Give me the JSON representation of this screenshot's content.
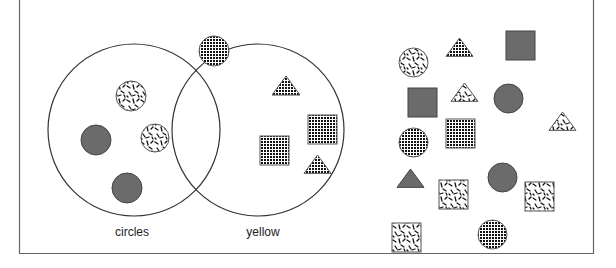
{
  "diagram": {
    "type": "venn",
    "frame": {
      "left": 19,
      "right": 593,
      "bottom": 253,
      "stroke": "#666666"
    },
    "sets": [
      {
        "id": "circles",
        "label": "circles",
        "cx": 134,
        "cy": 130,
        "r": 86,
        "label_x": 132,
        "label_y": 236
      },
      {
        "id": "yellow",
        "label": "yellow",
        "cx": 258,
        "cy": 130,
        "r": 86,
        "label_x": 263,
        "label_y": 236
      }
    ],
    "colors": {
      "solid_fill": "#6b6b6b",
      "outline": "#333333",
      "grid_ink": "#111111",
      "background": "#ffffff"
    },
    "fill_legend": {
      "solid": "solid gray fill",
      "grid": "checkered grid pattern",
      "speckle": "white with black speckle pattern"
    },
    "shapes": [
      {
        "kind": "circle",
        "fill": "grid",
        "x": 199,
        "y": 36,
        "size": 30,
        "region": "outside"
      },
      {
        "kind": "circle",
        "fill": "speckle",
        "x": 116,
        "y": 81,
        "size": 30,
        "region": "circles-only"
      },
      {
        "kind": "circle",
        "fill": "solid",
        "x": 81,
        "y": 125,
        "size": 30,
        "region": "circles-only"
      },
      {
        "kind": "circle",
        "fill": "speckle",
        "x": 141,
        "y": 124,
        "size": 28,
        "region": "circles-only"
      },
      {
        "kind": "circle",
        "fill": "solid",
        "x": 112,
        "y": 173,
        "size": 30,
        "region": "circles-only"
      },
      {
        "kind": "triangle",
        "fill": "grid",
        "x": 272,
        "y": 76,
        "size": 28,
        "region": "yellow-only"
      },
      {
        "kind": "square",
        "fill": "grid",
        "x": 308,
        "y": 115,
        "size": 29,
        "region": "yellow-only"
      },
      {
        "kind": "square",
        "fill": "grid",
        "x": 260,
        "y": 136,
        "size": 29,
        "region": "yellow-only"
      },
      {
        "kind": "triangle",
        "fill": "grid",
        "x": 304,
        "y": 155,
        "size": 27,
        "region": "yellow-only"
      },
      {
        "kind": "circle",
        "fill": "speckle",
        "x": 399,
        "y": 48,
        "size": 29,
        "region": "outside"
      },
      {
        "kind": "triangle",
        "fill": "grid",
        "x": 446,
        "y": 38,
        "size": 27,
        "region": "outside"
      },
      {
        "kind": "square",
        "fill": "solid",
        "x": 506,
        "y": 31,
        "size": 29,
        "region": "outside"
      },
      {
        "kind": "square",
        "fill": "solid",
        "x": 408,
        "y": 88,
        "size": 29,
        "region": "outside"
      },
      {
        "kind": "triangle",
        "fill": "speckle",
        "x": 451,
        "y": 83,
        "size": 27,
        "region": "outside"
      },
      {
        "kind": "circle",
        "fill": "solid",
        "x": 494,
        "y": 84,
        "size": 29,
        "region": "outside"
      },
      {
        "kind": "triangle",
        "fill": "speckle",
        "x": 549,
        "y": 112,
        "size": 27,
        "region": "outside"
      },
      {
        "kind": "circle",
        "fill": "grid",
        "x": 399,
        "y": 128,
        "size": 29,
        "region": "outside"
      },
      {
        "kind": "square",
        "fill": "grid",
        "x": 446,
        "y": 119,
        "size": 29,
        "region": "outside"
      },
      {
        "kind": "triangle",
        "fill": "solid",
        "x": 397,
        "y": 169,
        "size": 27,
        "region": "outside"
      },
      {
        "kind": "square",
        "fill": "speckle",
        "x": 439,
        "y": 180,
        "size": 29,
        "region": "outside"
      },
      {
        "kind": "circle",
        "fill": "solid",
        "x": 488,
        "y": 163,
        "size": 29,
        "region": "outside"
      },
      {
        "kind": "square",
        "fill": "speckle",
        "x": 525,
        "y": 182,
        "size": 29,
        "region": "outside"
      },
      {
        "kind": "square",
        "fill": "speckle",
        "x": 392,
        "y": 223,
        "size": 29,
        "region": "outside"
      },
      {
        "kind": "circle",
        "fill": "grid",
        "x": 478,
        "y": 220,
        "size": 29,
        "region": "outside"
      }
    ]
  }
}
